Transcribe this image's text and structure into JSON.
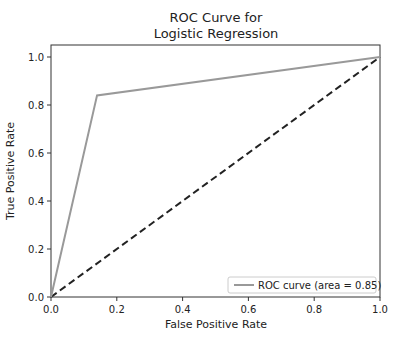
{
  "chart_data": {
    "type": "line",
    "title": [
      "ROC Curve for",
      "Logistic Regression"
    ],
    "xlabel": "False Positive Rate",
    "ylabel": "True Positive Rate",
    "xlim": [
      0.0,
      1.0
    ],
    "ylim": [
      0.0,
      1.05
    ],
    "xticks": [
      "0.0",
      "0.2",
      "0.4",
      "0.6",
      "0.8",
      "1.0"
    ],
    "yticks": [
      "0.0",
      "0.2",
      "0.4",
      "0.6",
      "0.8",
      "1.0"
    ],
    "grid": false,
    "legend_position": "lower right",
    "series": [
      {
        "name": "ROC curve (area = 0.85)",
        "x": [
          0.0,
          0.14,
          1.0
        ],
        "y": [
          0.0,
          0.84,
          1.0
        ],
        "color": "#999999",
        "style": "solid"
      },
      {
        "name": "chance",
        "x": [
          0.0,
          1.0
        ],
        "y": [
          0.0,
          1.0
        ],
        "color": "#222222",
        "style": "dashed"
      }
    ]
  }
}
